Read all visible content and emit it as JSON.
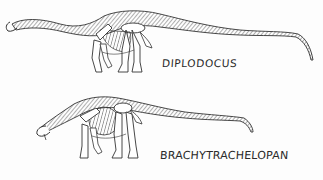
{
  "figure": {
    "specimens": [
      {
        "label": "DIPLODOCUS"
      },
      {
        "label": "BRACHYTRACHELOPAN"
      }
    ],
    "colors": {
      "background": "#fdfdfd",
      "ink": "#2a2a2a"
    }
  }
}
